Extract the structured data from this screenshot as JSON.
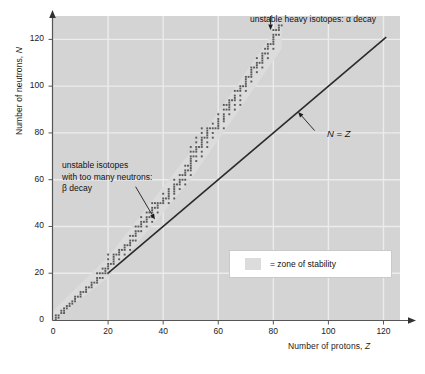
{
  "chart_data": {
    "type": "scatter",
    "title": "",
    "xlabel": "Number of protons, Z",
    "ylabel": "Number of neutrons, N",
    "xlim": [
      0,
      126
    ],
    "ylim": [
      0,
      130
    ],
    "grid": true,
    "xticks": [
      0,
      20,
      40,
      60,
      80,
      100,
      120
    ],
    "yticks": [
      0,
      20,
      40,
      60,
      80,
      100,
      120
    ],
    "legend_position": "inside-lower-right",
    "legend": [
      {
        "label": "= zone of stability",
        "color": "#dcdcdc",
        "marker": "swatch"
      }
    ],
    "series": [
      {
        "name": "stable isotopes",
        "marker": "square",
        "color": "#5a5a5a",
        "points": [
          [
            1,
            0
          ],
          [
            1,
            1
          ],
          [
            1,
            2
          ],
          [
            2,
            1
          ],
          [
            2,
            2
          ],
          [
            3,
            3
          ],
          [
            3,
            4
          ],
          [
            4,
            3
          ],
          [
            4,
            4
          ],
          [
            4,
            5
          ],
          [
            5,
            5
          ],
          [
            5,
            6
          ],
          [
            6,
            6
          ],
          [
            6,
            7
          ],
          [
            7,
            7
          ],
          [
            7,
            8
          ],
          [
            8,
            8
          ],
          [
            8,
            9
          ],
          [
            8,
            10
          ],
          [
            9,
            10
          ],
          [
            10,
            10
          ],
          [
            10,
            11
          ],
          [
            10,
            12
          ],
          [
            11,
            12
          ],
          [
            12,
            12
          ],
          [
            12,
            13
          ],
          [
            12,
            14
          ],
          [
            13,
            14
          ],
          [
            14,
            14
          ],
          [
            14,
            15
          ],
          [
            14,
            16
          ],
          [
            15,
            16
          ],
          [
            16,
            16
          ],
          [
            16,
            17
          ],
          [
            16,
            18
          ],
          [
            16,
            20
          ],
          [
            17,
            18
          ],
          [
            17,
            20
          ],
          [
            18,
            18
          ],
          [
            18,
            20
          ],
          [
            18,
            22
          ],
          [
            19,
            20
          ],
          [
            19,
            21
          ],
          [
            19,
            22
          ],
          [
            20,
            20
          ],
          [
            20,
            22
          ],
          [
            20,
            23
          ],
          [
            20,
            24
          ],
          [
            20,
            26
          ],
          [
            20,
            28
          ],
          [
            21,
            24
          ],
          [
            22,
            24
          ],
          [
            22,
            25
          ],
          [
            22,
            26
          ],
          [
            22,
            27
          ],
          [
            22,
            28
          ],
          [
            23,
            28
          ],
          [
            24,
            26
          ],
          [
            24,
            28
          ],
          [
            24,
            29
          ],
          [
            24,
            30
          ],
          [
            25,
            30
          ],
          [
            26,
            28
          ],
          [
            26,
            30
          ],
          [
            26,
            31
          ],
          [
            26,
            32
          ],
          [
            27,
            32
          ],
          [
            28,
            30
          ],
          [
            28,
            32
          ],
          [
            28,
            33
          ],
          [
            28,
            34
          ],
          [
            28,
            36
          ],
          [
            29,
            34
          ],
          [
            29,
            36
          ],
          [
            30,
            34
          ],
          [
            30,
            36
          ],
          [
            30,
            37
          ],
          [
            30,
            38
          ],
          [
            30,
            40
          ],
          [
            31,
            38
          ],
          [
            31,
            40
          ],
          [
            32,
            38
          ],
          [
            32,
            40
          ],
          [
            32,
            41
          ],
          [
            32,
            42
          ],
          [
            32,
            44
          ],
          [
            33,
            42
          ],
          [
            34,
            40
          ],
          [
            34,
            42
          ],
          [
            34,
            43
          ],
          [
            34,
            44
          ],
          [
            34,
            46
          ],
          [
            35,
            44
          ],
          [
            35,
            46
          ],
          [
            36,
            42
          ],
          [
            36,
            44
          ],
          [
            36,
            46
          ],
          [
            36,
            47
          ],
          [
            36,
            48
          ],
          [
            36,
            50
          ],
          [
            37,
            48
          ],
          [
            37,
            50
          ],
          [
            38,
            46
          ],
          [
            38,
            48
          ],
          [
            38,
            49
          ],
          [
            38,
            50
          ],
          [
            39,
            50
          ],
          [
            40,
            50
          ],
          [
            40,
            51
          ],
          [
            40,
            52
          ],
          [
            40,
            54
          ],
          [
            41,
            52
          ],
          [
            42,
            50
          ],
          [
            42,
            52
          ],
          [
            42,
            53
          ],
          [
            42,
            54
          ],
          [
            42,
            55
          ],
          [
            42,
            56
          ],
          [
            44,
            52
          ],
          [
            44,
            54
          ],
          [
            44,
            55
          ],
          [
            44,
            56
          ],
          [
            44,
            57
          ],
          [
            44,
            58
          ],
          [
            44,
            60
          ],
          [
            45,
            58
          ],
          [
            46,
            56
          ],
          [
            46,
            58
          ],
          [
            46,
            59
          ],
          [
            46,
            60
          ],
          [
            46,
            62
          ],
          [
            47,
            60
          ],
          [
            47,
            62
          ],
          [
            48,
            58
          ],
          [
            48,
            60
          ],
          [
            48,
            62
          ],
          [
            48,
            63
          ],
          [
            48,
            64
          ],
          [
            48,
            66
          ],
          [
            49,
            64
          ],
          [
            49,
            66
          ],
          [
            50,
            62
          ],
          [
            50,
            64
          ],
          [
            50,
            65
          ],
          [
            50,
            66
          ],
          [
            50,
            67
          ],
          [
            50,
            68
          ],
          [
            50,
            69
          ],
          [
            50,
            70
          ],
          [
            50,
            72
          ],
          [
            50,
            74
          ],
          [
            51,
            70
          ],
          [
            51,
            72
          ],
          [
            52,
            68
          ],
          [
            52,
            70
          ],
          [
            52,
            72
          ],
          [
            52,
            73
          ],
          [
            52,
            74
          ],
          [
            52,
            76
          ],
          [
            52,
            78
          ],
          [
            53,
            74
          ],
          [
            54,
            70
          ],
          [
            54,
            72
          ],
          [
            54,
            74
          ],
          [
            54,
            75
          ],
          [
            54,
            76
          ],
          [
            54,
            77
          ],
          [
            54,
            78
          ],
          [
            54,
            80
          ],
          [
            54,
            82
          ],
          [
            55,
            78
          ],
          [
            56,
            74
          ],
          [
            56,
            76
          ],
          [
            56,
            78
          ],
          [
            56,
            79
          ],
          [
            56,
            80
          ],
          [
            56,
            81
          ],
          [
            56,
            82
          ],
          [
            57,
            82
          ],
          [
            58,
            78
          ],
          [
            58,
            80
          ],
          [
            58,
            82
          ],
          [
            58,
            84
          ],
          [
            59,
            82
          ],
          [
            60,
            82
          ],
          [
            60,
            83
          ],
          [
            60,
            84
          ],
          [
            60,
            85
          ],
          [
            60,
            86
          ],
          [
            60,
            88
          ],
          [
            62,
            82
          ],
          [
            62,
            85
          ],
          [
            62,
            86
          ],
          [
            62,
            87
          ],
          [
            62,
            88
          ],
          [
            62,
            90
          ],
          [
            62,
            92
          ],
          [
            63,
            90
          ],
          [
            63,
            92
          ],
          [
            64,
            88
          ],
          [
            64,
            90
          ],
          [
            64,
            91
          ],
          [
            64,
            92
          ],
          [
            64,
            93
          ],
          [
            64,
            94
          ],
          [
            65,
            94
          ],
          [
            66,
            90
          ],
          [
            66,
            92
          ],
          [
            66,
            94
          ],
          [
            66,
            95
          ],
          [
            66,
            96
          ],
          [
            66,
            98
          ],
          [
            67,
            98
          ],
          [
            68,
            92
          ],
          [
            68,
            94
          ],
          [
            68,
            96
          ],
          [
            68,
            98
          ],
          [
            68,
            99
          ],
          [
            68,
            100
          ],
          [
            69,
            100
          ],
          [
            70,
            98
          ],
          [
            70,
            100
          ],
          [
            70,
            101
          ],
          [
            70,
            102
          ],
          [
            70,
            103
          ],
          [
            70,
            104
          ],
          [
            71,
            104
          ],
          [
            72,
            102
          ],
          [
            72,
            104
          ],
          [
            72,
            105
          ],
          [
            72,
            106
          ],
          [
            72,
            107
          ],
          [
            72,
            108
          ],
          [
            73,
            108
          ],
          [
            74,
            106
          ],
          [
            74,
            108
          ],
          [
            74,
            109
          ],
          [
            74,
            110
          ],
          [
            74,
            112
          ],
          [
            75,
            110
          ],
          [
            76,
            108
          ],
          [
            76,
            110
          ],
          [
            76,
            111
          ],
          [
            76,
            112
          ],
          [
            76,
            113
          ],
          [
            76,
            114
          ],
          [
            77,
            114
          ],
          [
            77,
            116
          ],
          [
            78,
            112
          ],
          [
            78,
            114
          ],
          [
            78,
            116
          ],
          [
            78,
            117
          ],
          [
            78,
            118
          ],
          [
            79,
            118
          ],
          [
            80,
            116
          ],
          [
            80,
            118
          ],
          [
            80,
            119
          ],
          [
            80,
            120
          ],
          [
            80,
            121
          ],
          [
            80,
            122
          ],
          [
            80,
            124
          ],
          [
            81,
            122
          ],
          [
            81,
            124
          ],
          [
            82,
            122
          ],
          [
            82,
            124
          ],
          [
            82,
            125
          ],
          [
            82,
            126
          ],
          [
            83,
            126
          ]
        ]
      }
    ],
    "reference_line": {
      "name": "N = Z",
      "label": "N = Z",
      "from": [
        20,
        20
      ],
      "to": [
        121,
        121
      ],
      "color": "#2a2a2a"
    },
    "band": {
      "name": "zone of stability",
      "color": "#dcdcdc",
      "lower_edge": [
        [
          0,
          0
        ],
        [
          20,
          18
        ],
        [
          50,
          60
        ],
        [
          83,
          116
        ]
      ],
      "upper_edge": [
        [
          0,
          4
        ],
        [
          20,
          27
        ],
        [
          50,
          72
        ],
        [
          83,
          128
        ]
      ]
    },
    "annotations": [
      {
        "name": "beta-decay",
        "lines": [
          "unstable isotopes",
          "with too many neutrons:",
          "β decay"
        ],
        "arrow_from": [
          30,
          57
        ],
        "arrow_to": [
          37,
          43
        ]
      },
      {
        "name": "alpha-decay",
        "lines": [
          "unstable heavy isotopes: α decay"
        ],
        "arrow_from": [
          79,
          131
        ],
        "arrow_to": [
          79,
          124
        ]
      },
      {
        "name": "n-equals-z",
        "lines": [
          "N = Z"
        ],
        "arrow_from": [
          95,
          81
        ],
        "arrow_to": [
          89,
          89
        ]
      }
    ]
  },
  "axes": {
    "ylabel": "Number of neutrons, N",
    "ylabel_prefix": "Number of neutrons, ",
    "ylabel_symbol": "N",
    "xlabel": "Number of protons, Z",
    "xlabel_prefix": "Number of protons, ",
    "xlabel_symbol": "Z",
    "yticks": [
      "0",
      "20",
      "40",
      "60",
      "80",
      "100",
      "120"
    ],
    "xticks": [
      "0",
      "20",
      "40",
      "60",
      "80",
      "100",
      "120"
    ]
  },
  "annotations": {
    "beta_line1": "unstable isotopes",
    "beta_line2": "with too many neutrons:",
    "beta_line3": "β decay",
    "alpha": "unstable heavy isotopes: α decay",
    "nz": "N = Z"
  },
  "legend": {
    "text": "= zone of stability",
    "swatch_color": "#dcdcdc"
  },
  "colors": {
    "plot_background": "#d4d4d4",
    "gridline": "#ececec",
    "band": "#dcdcdc",
    "point": "#5a5a5a",
    "line": "#2a2a2a",
    "axis": "#555555",
    "text": "#111111"
  }
}
